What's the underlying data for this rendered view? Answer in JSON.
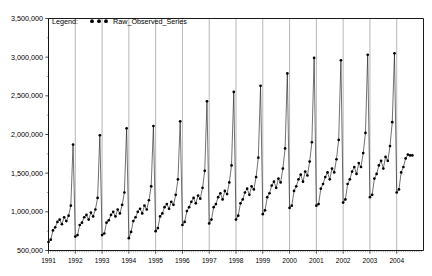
{
  "legend": {
    "label": "Legend:",
    "series_name": "Raw_Observed_Series",
    "marker": "filled-circle-triple",
    "marker_color": "#000000"
  },
  "axes": {
    "y_ticks": [
      "500,000",
      "1,000,000",
      "1,500,000",
      "2,000,000",
      "2,500,000",
      "3,000,000",
      "3,500,000"
    ],
    "y_tick_values": [
      500000,
      1000000,
      1500000,
      2000000,
      2500000,
      3000000,
      3500000
    ],
    "x_ticks": [
      "1991",
      "1992",
      "1993",
      "1994",
      "1995",
      "1996",
      "1997",
      "1998",
      "1999",
      "2000",
      "2001",
      "2002",
      "2003",
      "2004"
    ],
    "x_tick_values": [
      1991,
      1992,
      1993,
      1994,
      1995,
      1996,
      1997,
      1998,
      1999,
      2000,
      2001,
      2002,
      2003,
      2004
    ],
    "ylim": [
      500000,
      3500000
    ],
    "xlim": [
      1991.0,
      2005.0
    ],
    "grid": "vertical-only"
  },
  "chart_data": {
    "type": "line",
    "title": "",
    "subtitle": "",
    "xlabel": "",
    "ylabel": "",
    "ylim": [
      500000,
      3500000
    ],
    "xlim": [
      1991.0,
      2005.0
    ],
    "grid": true,
    "legend_position": "top-center-inside",
    "marker": "filled-circle",
    "line_color": "#000000",
    "x_start": "1991-01",
    "frequency": "monthly",
    "series": [
      {
        "name": "Raw_Observed_Series",
        "x": [
          1991.0,
          1991.0833,
          1991.1667,
          1991.25,
          1991.3333,
          1991.4167,
          1991.5,
          1991.5833,
          1991.6667,
          1991.75,
          1991.8333,
          1991.9167,
          1992.0,
          1992.0833,
          1992.1667,
          1992.25,
          1992.3333,
          1992.4167,
          1992.5,
          1992.5833,
          1992.6667,
          1992.75,
          1992.8333,
          1992.9167,
          1993.0,
          1993.0833,
          1993.1667,
          1993.25,
          1993.3333,
          1993.4167,
          1993.5,
          1993.5833,
          1993.6667,
          1993.75,
          1993.8333,
          1993.9167,
          1994.0,
          1994.0833,
          1994.1667,
          1994.25,
          1994.3333,
          1994.4167,
          1994.5,
          1994.5833,
          1994.6667,
          1994.75,
          1994.8333,
          1994.9167,
          1995.0,
          1995.0833,
          1995.1667,
          1995.25,
          1995.3333,
          1995.4167,
          1995.5,
          1995.5833,
          1995.6667,
          1995.75,
          1995.8333,
          1995.9167,
          1996.0,
          1996.0833,
          1996.1667,
          1996.25,
          1996.3333,
          1996.4167,
          1996.5,
          1996.5833,
          1996.6667,
          1996.75,
          1996.8333,
          1996.9167,
          1997.0,
          1997.0833,
          1997.1667,
          1997.25,
          1997.3333,
          1997.4167,
          1997.5,
          1997.5833,
          1997.6667,
          1997.75,
          1997.8333,
          1997.9167,
          1998.0,
          1998.0833,
          1998.1667,
          1998.25,
          1998.3333,
          1998.4167,
          1998.5,
          1998.5833,
          1998.6667,
          1998.75,
          1998.8333,
          1998.9167,
          1999.0,
          1999.0833,
          1999.1667,
          1999.25,
          1999.3333,
          1999.4167,
          1999.5,
          1999.5833,
          1999.6667,
          1999.75,
          1999.8333,
          1999.9167,
          2000.0,
          2000.0833,
          2000.1667,
          2000.25,
          2000.3333,
          2000.4167,
          2000.5,
          2000.5833,
          2000.6667,
          2000.75,
          2000.8333,
          2000.9167,
          2001.0,
          2001.0833,
          2001.1667,
          2001.25,
          2001.3333,
          2001.4167,
          2001.5,
          2001.5833,
          2001.6667,
          2001.75,
          2001.8333,
          2001.9167,
          2002.0,
          2002.0833,
          2002.1667,
          2002.25,
          2002.3333,
          2002.4167,
          2002.5,
          2002.5833,
          2002.6667,
          2002.75,
          2002.8333,
          2002.9167,
          2003.0,
          2003.0833,
          2003.1667,
          2003.25,
          2003.3333,
          2003.4167,
          2003.5,
          2003.5833,
          2003.6667,
          2003.75,
          2003.8333,
          2003.9167,
          2004.0,
          2004.0833,
          2004.1667,
          2004.25,
          2004.3333,
          2004.4167,
          2004.5,
          2004.5833
        ],
        "values": [
          610000,
          640000,
          760000,
          800000,
          870000,
          900000,
          840000,
          930000,
          880000,
          950000,
          1080000,
          1870000,
          680000,
          700000,
          830000,
          860000,
          930000,
          960000,
          900000,
          990000,
          940000,
          1030000,
          1180000,
          1990000,
          700000,
          720000,
          860000,
          890000,
          960000,
          1000000,
          940000,
          1030000,
          980000,
          1090000,
          1250000,
          2080000,
          660000,
          740000,
          880000,
          930000,
          1000000,
          1040000,
          980000,
          1080000,
          1030000,
          1150000,
          1330000,
          2110000,
          750000,
          790000,
          940000,
          980000,
          1060000,
          1100000,
          1040000,
          1130000,
          1090000,
          1220000,
          1420000,
          2170000,
          830000,
          870000,
          1010000,
          1060000,
          1130000,
          1180000,
          1110000,
          1210000,
          1170000,
          1310000,
          1530000,
          2430000,
          850000,
          900000,
          1060000,
          1100000,
          1190000,
          1240000,
          1160000,
          1270000,
          1230000,
          1380000,
          1600000,
          2550000,
          900000,
          950000,
          1110000,
          1160000,
          1250000,
          1300000,
          1220000,
          1330000,
          1290000,
          1450000,
          1700000,
          2630000,
          970000,
          1020000,
          1190000,
          1240000,
          1340000,
          1390000,
          1310000,
          1430000,
          1380000,
          1560000,
          1820000,
          2790000,
          1050000,
          1080000,
          1270000,
          1330000,
          1420000,
          1480000,
          1390000,
          1520000,
          1470000,
          1650000,
          1900000,
          2990000,
          1080000,
          1100000,
          1300000,
          1360000,
          1450000,
          1510000,
          1420000,
          1560000,
          1510000,
          1680000,
          1930000,
          2960000,
          1120000,
          1160000,
          1360000,
          1420000,
          1520000,
          1580000,
          1490000,
          1630000,
          1580000,
          1760000,
          2020000,
          3030000,
          1190000,
          1220000,
          1430000,
          1490000,
          1600000,
          1660000,
          1560000,
          1710000,
          1660000,
          1850000,
          2160000,
          3050000,
          1250000,
          1290000,
          1510000,
          1580000,
          1690000,
          1740000,
          1730000,
          1730000
        ]
      }
    ]
  }
}
